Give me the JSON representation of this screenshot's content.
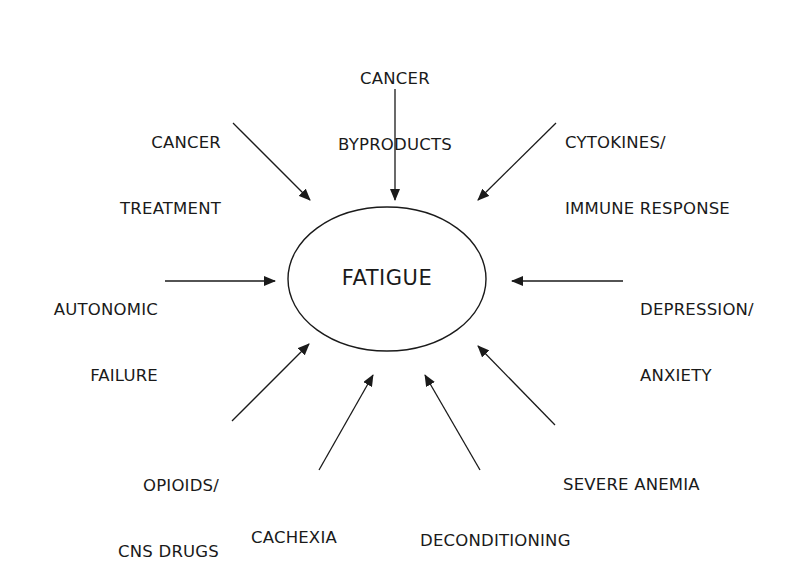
{
  "diagram": {
    "center": {
      "label": "FATIGUE"
    },
    "factors": [
      {
        "id": "cancer-byproducts",
        "lines": [
          "CANCER",
          "BYPRODUCTS"
        ]
      },
      {
        "id": "cancer-treatment",
        "lines": [
          "CANCER",
          "TREATMENT"
        ]
      },
      {
        "id": "cytokines",
        "lines": [
          "CYTOKINES/",
          "IMMUNE RESPONSE"
        ]
      },
      {
        "id": "autonomic-failure",
        "lines": [
          "AUTONOMIC",
          "FAILURE"
        ]
      },
      {
        "id": "depression-anxiety",
        "lines": [
          "DEPRESSION/",
          "ANXIETY"
        ]
      },
      {
        "id": "opioids",
        "lines": [
          "OPIOIDS/",
          "CNS DRUGS"
        ]
      },
      {
        "id": "cachexia",
        "lines": [
          "CACHEXIA"
        ]
      },
      {
        "id": "deconditioning",
        "lines": [
          "DECONDITIONING"
        ]
      },
      {
        "id": "severe-anemia",
        "lines": [
          "SEVERE ANEMIA"
        ]
      }
    ],
    "colors": {
      "line": "#1a1a1a",
      "background": "#ffffff"
    }
  }
}
